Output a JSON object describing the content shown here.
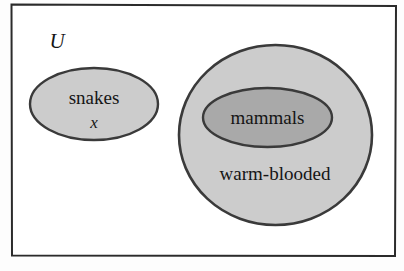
{
  "diagram": {
    "kind": "euler-diagram",
    "universe": {
      "label": "U",
      "border_color": "#2b2b2b",
      "fill_color": "#ffffff"
    },
    "sets": [
      {
        "id": "snakes",
        "label": "snakes",
        "fill_color": "#cccccc",
        "stroke_color": "#3a3a3a"
      },
      {
        "id": "warm-blooded",
        "label": "warm-blooded",
        "fill_color": "#cccccc",
        "stroke_color": "#3a3a3a"
      },
      {
        "id": "mammals",
        "label": "mammals",
        "fill_color": "#a9a9a9",
        "stroke_color": "#3a3a3a"
      }
    ],
    "elements": [
      {
        "id": "x",
        "label": "x",
        "member_of": "snakes"
      }
    ]
  }
}
